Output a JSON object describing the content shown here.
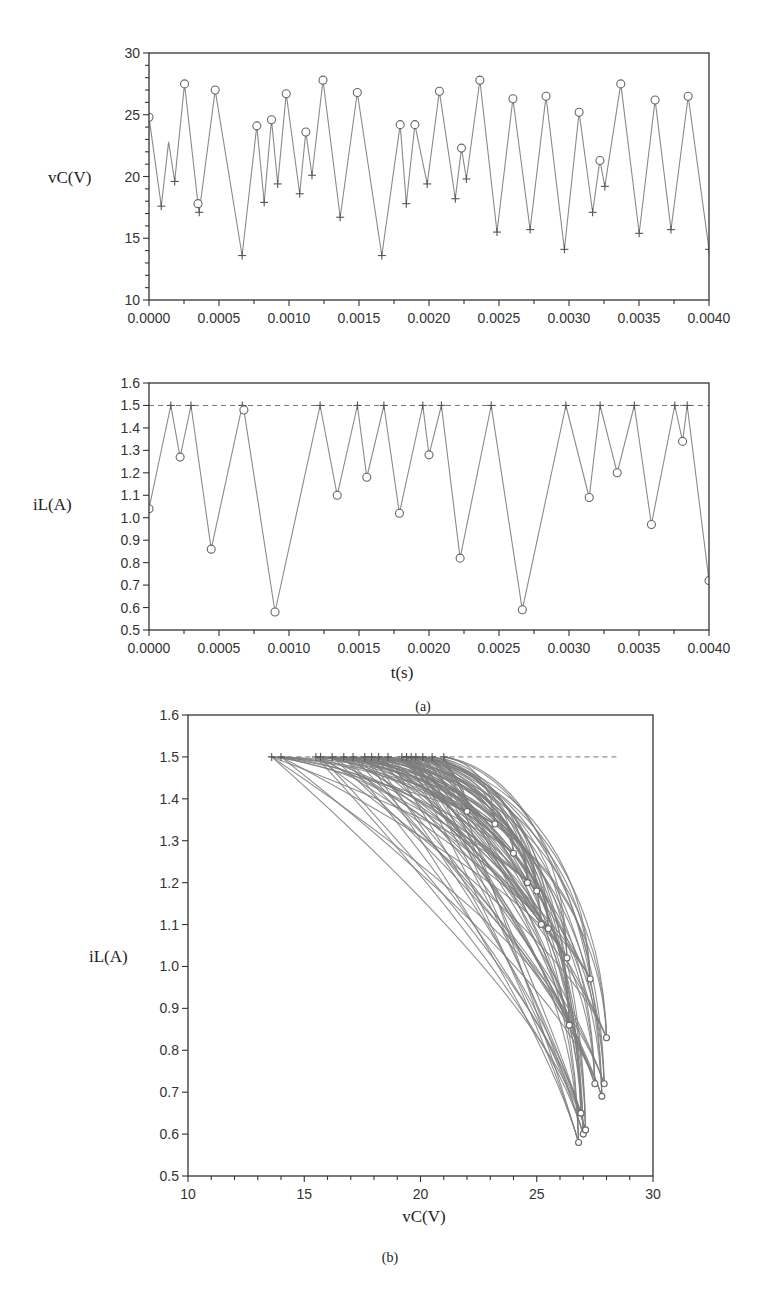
{
  "figure": {
    "panel_a_caption": "(a)",
    "panel_b_caption": "(b)"
  },
  "chart_data": [
    {
      "id": "vc_time",
      "type": "line",
      "title": "",
      "xlabel": "",
      "ylabel": "vC(V)",
      "xlim": [
        0.0,
        0.004
      ],
      "ylim": [
        10,
        30
      ],
      "x_ticks": [
        "0.0000",
        "0.0005",
        "0.0010",
        "0.0015",
        "0.0020",
        "0.0025",
        "0.0030",
        "0.0035",
        "0.0040"
      ],
      "y_ticks": [
        "10",
        "15",
        "20",
        "25",
        "30"
      ],
      "grid": false,
      "markers": {
        "circle": "sampled peaks (switch-off)",
        "plus": "troughs (switch-on)"
      },
      "series": [
        {
          "name": "vC",
          "points": [
            [
              0.0,
              24.8,
              "o"
            ],
            [
              0.0001,
              17.6,
              "+"
            ],
            [
              0.00016,
              22.8,
              ""
            ],
            [
              0.00021,
              19.6,
              "+"
            ],
            [
              0.00029,
              27.5,
              "o"
            ],
            [
              0.0004,
              17.8,
              "o"
            ],
            [
              0.00041,
              17.1,
              "+"
            ],
            [
              0.00054,
              27.0,
              "o"
            ],
            [
              0.00076,
              13.6,
              "+"
            ],
            [
              0.00088,
              24.1,
              "o"
            ],
            [
              0.00094,
              17.9,
              "+"
            ],
            [
              0.001,
              24.6,
              "o"
            ],
            [
              0.00105,
              19.4,
              "+"
            ],
            [
              0.00112,
              26.7,
              "o"
            ],
            [
              0.00123,
              18.6,
              "+"
            ],
            [
              0.00128,
              23.6,
              "o"
            ],
            [
              0.00133,
              20.1,
              "+"
            ],
            [
              0.00142,
              27.8,
              "o"
            ],
            [
              0.00156,
              16.7,
              "+"
            ],
            [
              0.0017,
              26.8,
              "o"
            ],
            [
              0.0019,
              13.6,
              "+"
            ],
            [
              0.00205,
              24.2,
              "o"
            ],
            [
              0.0021,
              17.8,
              "+"
            ],
            [
              0.00217,
              24.2,
              "o"
            ],
            [
              0.00227,
              19.4,
              "+"
            ],
            [
              0.00237,
              26.9,
              "o"
            ],
            [
              0.0025,
              18.2,
              "+"
            ],
            [
              0.00255,
              22.3,
              "o"
            ],
            [
              0.00259,
              19.8,
              "+"
            ],
            [
              0.0027,
              27.8,
              "o"
            ],
            [
              0.00284,
              15.5,
              "+"
            ],
            [
              0.00297,
              26.3,
              "o"
            ],
            [
              0.00311,
              15.7,
              "+"
            ],
            [
              0.00324,
              26.5,
              "o"
            ],
            [
              0.00339,
              14.1,
              "+"
            ],
            [
              0.00351,
              25.2,
              "o"
            ],
            [
              0.00362,
              17.1,
              "+"
            ],
            [
              0.00368,
              21.3,
              "o"
            ],
            [
              0.00372,
              19.2,
              "+"
            ],
            [
              0.00385,
              27.5,
              "o"
            ],
            [
              0.004,
              15.4,
              "+"
            ],
            [
              0.00413,
              26.2,
              "o"
            ],
            [
              0.00426,
              15.7,
              "+"
            ],
            [
              0.0044,
              26.5,
              "o"
            ],
            [
              0.00457,
              14.1,
              "+"
            ]
          ]
        }
      ]
    },
    {
      "id": "il_time",
      "type": "line",
      "title": "",
      "xlabel": "t(s)",
      "ylabel": "iL(A)",
      "xlim": [
        0.0,
        0.004
      ],
      "ylim": [
        0.5,
        1.6
      ],
      "x_ticks": [
        "0.0000",
        "0.0005",
        "0.0010",
        "0.0015",
        "0.0020",
        "0.0025",
        "0.0030",
        "0.0035",
        "0.0040"
      ],
      "y_ticks": [
        "0.5",
        "0.6",
        "0.7",
        "0.8",
        "0.9",
        "1.0",
        "1.1",
        "1.2",
        "1.3",
        "1.4",
        "1.5",
        "1.6"
      ],
      "reference_line": {
        "y": 1.5,
        "style": "dashed",
        "label": "Iref"
      },
      "grid": false,
      "series": [
        {
          "name": "iL",
          "points": [
            [
              0.0,
              1.04,
              "o"
            ],
            [
              0.00014,
              1.5,
              "+"
            ],
            [
              0.0002,
              1.27,
              "o"
            ],
            [
              0.00027,
              1.5,
              "+"
            ],
            [
              0.0004,
              0.86,
              "o"
            ],
            [
              0.0006,
              1.5,
              "+"
            ],
            [
              0.00061,
              1.48,
              "o"
            ],
            [
              0.00081,
              0.58,
              "o"
            ],
            [
              0.0011,
              1.5,
              "+"
            ],
            [
              0.00121,
              1.1,
              "o"
            ],
            [
              0.00134,
              1.5,
              "+"
            ],
            [
              0.0014,
              1.18,
              "o"
            ],
            [
              0.00151,
              1.5,
              "+"
            ],
            [
              0.00161,
              1.02,
              "o"
            ],
            [
              0.00176,
              1.5,
              "+"
            ],
            [
              0.0018,
              1.28,
              "o"
            ],
            [
              0.00188,
              1.5,
              "+"
            ],
            [
              0.002,
              0.82,
              "o"
            ],
            [
              0.0022,
              1.5,
              "+"
            ],
            [
              0.0024,
              0.59,
              "o"
            ],
            [
              0.00268,
              1.5,
              "+"
            ],
            [
              0.00283,
              1.09,
              "o"
            ],
            [
              0.0029,
              1.5,
              "+"
            ],
            [
              0.00301,
              1.2,
              "o"
            ],
            [
              0.00312,
              1.5,
              "+"
            ],
            [
              0.00323,
              0.97,
              "o"
            ],
            [
              0.00338,
              1.5,
              "+"
            ],
            [
              0.00343,
              1.34,
              "o"
            ],
            [
              0.00346,
              1.5,
              "+"
            ],
            [
              0.0036,
              0.72,
              "o"
            ]
          ]
        }
      ]
    },
    {
      "id": "phase_portrait",
      "type": "line",
      "title": "",
      "xlabel": "vC(V)",
      "ylabel": "iL(A)",
      "xlim": [
        10,
        30
      ],
      "ylim": [
        0.5,
        1.6
      ],
      "x_ticks": [
        "10",
        "15",
        "20",
        "25",
        "30"
      ],
      "y_ticks": [
        "0.5",
        "0.6",
        "0.7",
        "0.8",
        "0.9",
        "1.0",
        "1.1",
        "1.2",
        "1.3",
        "1.4",
        "1.5",
        "1.6"
      ],
      "reference_line": {
        "y": 1.5,
        "x_range": [
          13.5,
          28.5
        ],
        "style": "dashed"
      },
      "description": "Chaotic attractor: many trajectories start at iL=1.5 (plus markers, vC 13.5–21.5) and curve down to iL minima (circle markers) near vC 25–28, iL 0.58–1.4",
      "start_points_vC": [
        13.6,
        14.0,
        15.5,
        15.7,
        16.2,
        16.7,
        17.1,
        17.6,
        17.9,
        18.2,
        18.6,
        19.2,
        19.4,
        19.6,
        19.8,
        20.1,
        20.5,
        21.0
      ],
      "end_points": [
        [
          26.8,
          0.58
        ],
        [
          27.0,
          0.6
        ],
        [
          27.1,
          0.61
        ],
        [
          26.9,
          0.65
        ],
        [
          27.8,
          0.69
        ],
        [
          27.9,
          0.72
        ],
        [
          27.5,
          0.72
        ],
        [
          28.0,
          0.83
        ],
        [
          26.4,
          0.86
        ],
        [
          27.3,
          0.97
        ],
        [
          26.3,
          1.02
        ],
        [
          25.5,
          1.09
        ],
        [
          25.2,
          1.1
        ],
        [
          25.0,
          1.18
        ],
        [
          24.6,
          1.2
        ],
        [
          24.0,
          1.27
        ],
        [
          23.2,
          1.34
        ],
        [
          22.0,
          1.37
        ]
      ]
    }
  ]
}
